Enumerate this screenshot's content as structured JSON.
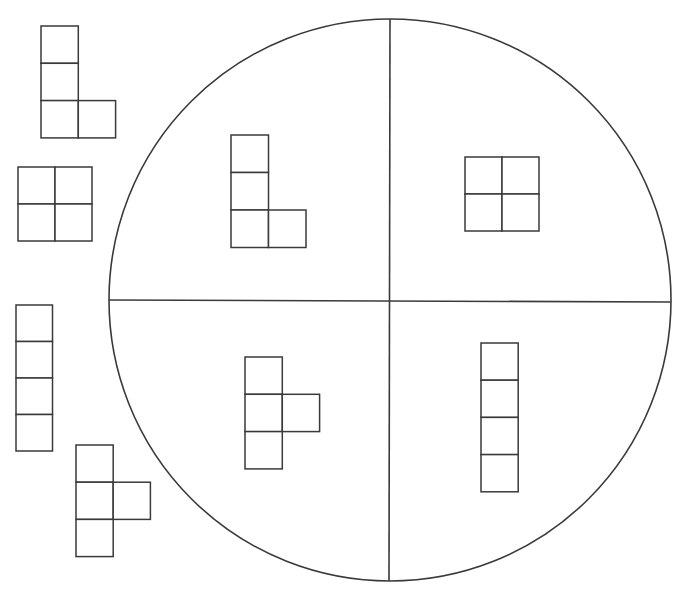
{
  "diagram": {
    "title": "Tetromino sorting worksheet",
    "circle": {
      "divisions": 4,
      "quadrants": [
        {
          "position": "top-left",
          "contains": "L-tetromino"
        },
        {
          "position": "top-right",
          "contains": "O-tetromino (2x2 square)"
        },
        {
          "position": "bottom-left",
          "contains": "T-tetromino"
        },
        {
          "position": "bottom-right",
          "contains": "I-tetromino (4 in a column)"
        }
      ]
    },
    "loose_pieces": [
      {
        "shape": "L-tetromino",
        "position": "top-left"
      },
      {
        "shape": "O-tetromino (2x2 square)",
        "position": "middle-left"
      },
      {
        "shape": "I-tetromino (4 in a column)",
        "position": "lower-left"
      },
      {
        "shape": "T-tetromino",
        "position": "bottom-left"
      }
    ],
    "colors": {
      "line": "#3a3a3a",
      "background": "#ffffff"
    }
  }
}
